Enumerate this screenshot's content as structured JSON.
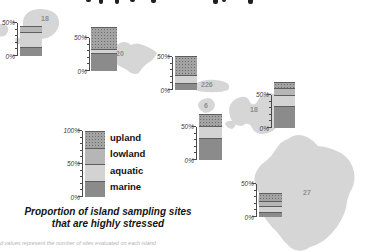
{
  "colors": {
    "marine": "#8b8b8b",
    "aquatic": "#d3d3d3",
    "lowland": "#b6b6b6",
    "upland": "#a3a3a3",
    "upland_dot": "#6f6f6f",
    "island_fill": "#d6d6d6",
    "segment_divider": "#5e5e5e",
    "axis": "#4a4a4a",
    "island_number": "#8f8f8f"
  },
  "chart_data": {
    "type": "bar",
    "subtype": "stacked_percentage_bars_over_island_map",
    "title": "Proportion of island sampling sites that are highly stressed",
    "footnote": "d values represent the number of sites evaluated on each island",
    "stack_order_bottom_to_top": [
      "marine",
      "aquatic",
      "lowland",
      "upland"
    ],
    "mini_axis": {
      "max_pct": 50,
      "tick_step_pct": 10,
      "top_label": "50%",
      "bottom_label": "0%"
    },
    "legend": {
      "axis": {
        "max_pct": 100,
        "tick_step_pct": 10,
        "top_label": "100%",
        "mid_label": "50%",
        "bottom_label": "0%"
      },
      "items": [
        {
          "key": "upland",
          "label": "upland",
          "value_pct": 25
        },
        {
          "key": "lowland",
          "label": "lowland",
          "value_pct": 25
        },
        {
          "key": "aquatic",
          "label": "aquatic",
          "value_pct": 25
        },
        {
          "key": "marine",
          "label": "marine",
          "value_pct": 25
        }
      ]
    },
    "charts": [
      {
        "sites_label": "18",
        "segments": {
          "marine": 13,
          "aquatic": 23,
          "lowland": 9,
          "upland": 0
        },
        "total_pct": 45
      },
      {
        "sites_label": "20",
        "segments": {
          "marine": 27,
          "aquatic": 6,
          "lowland": 0,
          "upland": 33
        },
        "total_pct": 66
      },
      {
        "sites_label": "226",
        "segments": {
          "marine": 10,
          "aquatic": 13,
          "lowland": 0,
          "upland": 29
        },
        "total_pct": 52
      },
      {
        "sites_label": "6",
        "segments": {
          "marine": 33,
          "aquatic": 18,
          "lowland": 0,
          "upland": 19
        },
        "total_pct": 70
      },
      {
        "sites_label": "18",
        "segments": {
          "marine": 33,
          "aquatic": 17,
          "lowland": 11,
          "upland": 9
        },
        "total_pct": 70
      },
      {
        "sites_label": "27",
        "segments": {
          "marine": 7,
          "aquatic": 9,
          "lowland": 9,
          "upland": 11
        },
        "total_pct": 36
      }
    ]
  }
}
